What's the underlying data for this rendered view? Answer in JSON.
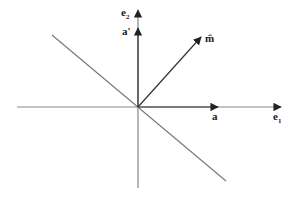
{
  "diagram": {
    "type": "vector-axes",
    "colors": {
      "axis": "#888888",
      "vector": "#222222",
      "diagonal": "#777777",
      "label": "#222222"
    },
    "labels": {
      "e1": {
        "main": "e",
        "sub": "1"
      },
      "e2": {
        "main": "e",
        "sub": "2"
      },
      "a": "a",
      "a_prime": "a'",
      "m_hat": "m̂"
    }
  }
}
